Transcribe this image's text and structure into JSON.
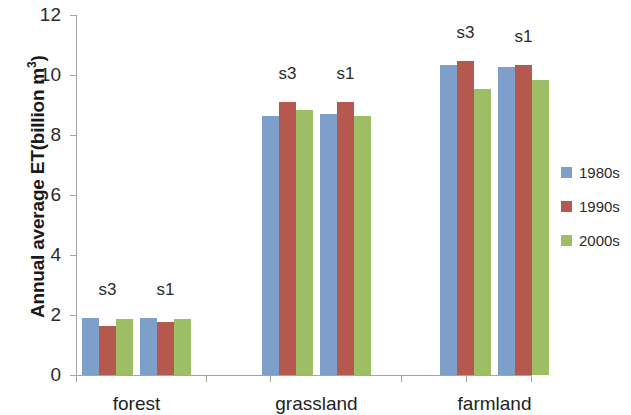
{
  "chart_data": {
    "type": "bar",
    "title": "",
    "xlabel": "",
    "ylabel": "Annual average ET(billion m",
    "ylabel_sup": "3",
    "ylabel_suffix": ")",
    "ylim": [
      0,
      12
    ],
    "yticks": [
      0,
      2,
      4,
      6,
      8,
      10,
      12
    ],
    "ytick_labels": [
      "0",
      "2",
      "4",
      "6",
      "8",
      "10",
      "12"
    ],
    "grid": false,
    "legend_position": "right",
    "categories": [
      "forest",
      "grassland",
      "farmland"
    ],
    "scenarios": [
      "s3",
      "s1"
    ],
    "series": [
      {
        "name": "1980s",
        "color": "#7d9fc9",
        "values": {
          "forest": {
            "s3": 1.9,
            "s1": 1.9
          },
          "grassland": {
            "s3": 8.65,
            "s1": 8.7
          },
          "farmland": {
            "s3": 10.35,
            "s1": 10.28
          }
        }
      },
      {
        "name": "1990s",
        "color": "#b5584d",
        "values": {
          "forest": {
            "s3": 1.65,
            "s1": 1.78
          },
          "grassland": {
            "s3": 9.1,
            "s1": 9.1
          },
          "farmland": {
            "s3": 10.48,
            "s1": 10.35
          }
        }
      },
      {
        "name": "2000s",
        "color": "#9dbe64",
        "values": {
          "forest": {
            "s3": 1.86,
            "s1": 1.86
          },
          "grassland": {
            "s3": 8.85,
            "s1": 8.65
          },
          "farmland": {
            "s3": 9.55,
            "s1": 9.82
          }
        }
      }
    ],
    "groups": [
      {
        "category": "forest",
        "scenario": "s3",
        "values": [
          1.9,
          1.65,
          1.86
        ]
      },
      {
        "category": "forest",
        "scenario": "s1",
        "values": [
          1.9,
          1.78,
          1.86
        ]
      },
      {
        "category": "grassland",
        "scenario": "s3",
        "values": [
          8.65,
          9.1,
          8.85
        ]
      },
      {
        "category": "grassland",
        "scenario": "s1",
        "values": [
          8.7,
          9.1,
          8.65
        ]
      },
      {
        "category": "farmland",
        "scenario": "s3",
        "values": [
          10.35,
          10.48,
          9.55
        ]
      },
      {
        "category": "farmland",
        "scenario": "s1",
        "values": [
          10.28,
          10.35,
          9.82
        ]
      }
    ],
    "legend": [
      {
        "label": "1980s",
        "color": "#7d9fc9"
      },
      {
        "label": "1990s",
        "color": "#b5584d"
      },
      {
        "label": "2000s",
        "color": "#9dbe64"
      }
    ]
  },
  "axis": {
    "y_title_main": "Annual average ET(billion m",
    "y_title_sup": "3",
    "y_title_tail": ")"
  }
}
